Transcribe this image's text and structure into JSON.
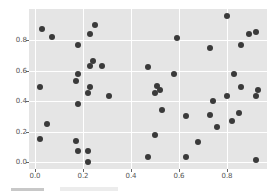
{
  "chart_data": {
    "type": "scatter",
    "title": "",
    "xlabel": "",
    "ylabel": "",
    "xlim": [
      -0.025,
      0.965
    ],
    "ylim": [
      -0.05,
      1.0
    ],
    "grid": true,
    "background": "#e5e5e5",
    "marker_color": "#3a3a3a",
    "x_ticks": [
      "0.0",
      "0.2",
      "0.4",
      "0.6",
      "0.8"
    ],
    "y_ticks": [
      "0.0",
      "0.2",
      "0.4",
      "0.6",
      "0.8"
    ],
    "points": [
      [
        0.03,
        0.87
      ],
      [
        0.07,
        0.82
      ],
      [
        0.02,
        0.49
      ],
      [
        0.05,
        0.25
      ],
      [
        0.02,
        0.15
      ],
      [
        0.25,
        0.9
      ],
      [
        0.23,
        0.84
      ],
      [
        0.18,
        0.77
      ],
      [
        0.24,
        0.66
      ],
      [
        0.23,
        0.63
      ],
      [
        0.28,
        0.63
      ],
      [
        0.18,
        0.58
      ],
      [
        0.17,
        0.53
      ],
      [
        0.23,
        0.49
      ],
      [
        0.22,
        0.45
      ],
      [
        0.31,
        0.43
      ],
      [
        0.18,
        0.38
      ],
      [
        0.17,
        0.14
      ],
      [
        0.18,
        0.07
      ],
      [
        0.22,
        0.07
      ],
      [
        0.22,
        0.0
      ],
      [
        0.47,
        0.62
      ],
      [
        0.58,
        0.58
      ],
      [
        0.51,
        0.5
      ],
      [
        0.52,
        0.47
      ],
      [
        0.5,
        0.45
      ],
      [
        0.53,
        0.34
      ],
      [
        0.63,
        0.3
      ],
      [
        0.5,
        0.18
      ],
      [
        0.68,
        0.13
      ],
      [
        0.47,
        0.03
      ],
      [
        0.63,
        0.03
      ],
      [
        0.59,
        0.81
      ],
      [
        0.8,
        0.96
      ],
      [
        0.89,
        0.84
      ],
      [
        0.92,
        0.85
      ],
      [
        0.86,
        0.77
      ],
      [
        0.73,
        0.75
      ],
      [
        0.83,
        0.58
      ],
      [
        0.86,
        0.49
      ],
      [
        0.93,
        0.47
      ],
      [
        0.92,
        0.43
      ],
      [
        0.74,
        0.4
      ],
      [
        0.8,
        0.43
      ],
      [
        0.73,
        0.31
      ],
      [
        0.85,
        0.32
      ],
      [
        0.76,
        0.23
      ],
      [
        0.82,
        0.27
      ],
      [
        0.92,
        0.01
      ]
    ]
  }
}
